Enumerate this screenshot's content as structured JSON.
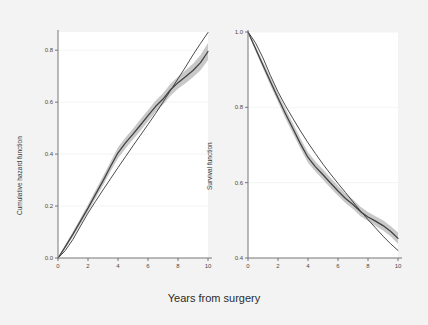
{
  "figure": {
    "background_color": "#f3f3f3",
    "plot_background_color": "#ffffff",
    "xlabel_shared": "Years from surgery"
  },
  "chart_data": [
    {
      "type": "line",
      "panel": "left",
      "title": "",
      "xlabel": "Years from surgery",
      "ylabel": "Cumulative hazard function",
      "xlim": [
        0,
        10
      ],
      "ylim": [
        0.0,
        0.87
      ],
      "xticks": [
        0,
        2,
        4,
        6,
        8,
        10
      ],
      "xtick_labels": [
        "0",
        "2",
        "4",
        "6",
        "8",
        "10"
      ],
      "yticks": [
        0.0,
        0.2,
        0.4,
        0.6,
        0.8
      ],
      "ytick_labels": [
        "0.0",
        "0.2",
        "0.4",
        "0.6",
        "0.8"
      ],
      "grid": "horizontal-faint",
      "legend_position": "none",
      "band_color": "#b3b3b3",
      "line_color": "#404040",
      "reference_line_color": "#2b2b2b",
      "x": [
        0,
        0.25,
        0.5,
        1,
        1.5,
        2,
        2.5,
        3,
        3.5,
        4,
        4.5,
        5,
        5.5,
        6,
        6.5,
        7,
        7.5,
        8,
        8.5,
        9,
        9.5,
        10
      ],
      "series": [
        {
          "name": "Flexible parametric cumulative hazard",
          "values": [
            0.0,
            0.022,
            0.045,
            0.092,
            0.142,
            0.192,
            0.245,
            0.297,
            0.352,
            0.405,
            0.443,
            0.477,
            0.512,
            0.548,
            0.583,
            0.612,
            0.648,
            0.675,
            0.698,
            0.722,
            0.752,
            0.795
          ]
        },
        {
          "name": "Reference (Weibull / straight) cumulative hazard",
          "values": [
            0.0,
            0.014,
            0.03,
            0.072,
            0.123,
            0.173,
            0.218,
            0.262,
            0.305,
            0.348,
            0.39,
            0.432,
            0.473,
            0.514,
            0.556,
            0.6,
            0.645,
            0.69,
            0.735,
            0.782,
            0.826,
            0.868
          ]
        },
        {
          "name": "95% CI lower",
          "values": [
            0.0,
            0.018,
            0.038,
            0.082,
            0.13,
            0.178,
            0.229,
            0.279,
            0.333,
            0.384,
            0.422,
            0.456,
            0.49,
            0.526,
            0.561,
            0.59,
            0.625,
            0.652,
            0.673,
            0.696,
            0.723,
            0.762
          ]
        },
        {
          "name": "95% CI upper",
          "values": [
            0.0,
            0.027,
            0.053,
            0.102,
            0.154,
            0.206,
            0.261,
            0.315,
            0.371,
            0.426,
            0.464,
            0.498,
            0.534,
            0.57,
            0.605,
            0.634,
            0.671,
            0.698,
            0.723,
            0.748,
            0.781,
            0.828
          ]
        }
      ]
    },
    {
      "type": "line",
      "panel": "right",
      "title": "",
      "xlabel": "Years from surgery",
      "ylabel": "Survival function",
      "xlim": [
        0,
        10
      ],
      "ylim": [
        0.4,
        1.0
      ],
      "xticks": [
        0,
        2,
        4,
        6,
        8,
        10
      ],
      "xtick_labels": [
        "0",
        "2",
        "4",
        "6",
        "8",
        "10"
      ],
      "yticks": [
        0.4,
        0.6,
        0.8,
        1.0
      ],
      "ytick_labels": [
        "0.4",
        "0.6",
        "0.8",
        "1.0"
      ],
      "grid": "horizontal-faint",
      "legend_position": "none",
      "band_color": "#b3b3b3",
      "line_color": "#404040",
      "reference_line_color": "#2b2b2b",
      "x": [
        0,
        0.25,
        0.5,
        1,
        1.5,
        2,
        2.5,
        3,
        3.5,
        4,
        4.5,
        5,
        5.5,
        6,
        6.5,
        7,
        7.5,
        8,
        8.5,
        9,
        9.5,
        10
      ],
      "series": [
        {
          "name": "Flexible parametric survival",
          "values": [
            1.0,
            0.978,
            0.956,
            0.912,
            0.868,
            0.825,
            0.783,
            0.743,
            0.703,
            0.667,
            0.642,
            0.621,
            0.599,
            0.578,
            0.558,
            0.542,
            0.523,
            0.509,
            0.498,
            0.486,
            0.471,
            0.452
          ]
        },
        {
          "name": "Reference (Weibull / smooth) survival",
          "values": [
            1.0,
            0.986,
            0.971,
            0.931,
            0.884,
            0.841,
            0.804,
            0.77,
            0.737,
            0.706,
            0.677,
            0.649,
            0.623,
            0.598,
            0.574,
            0.549,
            0.525,
            0.502,
            0.48,
            0.458,
            0.438,
            0.42
          ]
        },
        {
          "name": "95% CI lower",
          "values": [
            1.0,
            0.974,
            0.949,
            0.903,
            0.857,
            0.814,
            0.77,
            0.73,
            0.69,
            0.653,
            0.629,
            0.608,
            0.586,
            0.565,
            0.546,
            0.53,
            0.511,
            0.498,
            0.485,
            0.473,
            0.458,
            0.437
          ]
        },
        {
          "name": "95% CI upper",
          "values": [
            1.0,
            0.982,
            0.963,
            0.921,
            0.879,
            0.837,
            0.796,
            0.757,
            0.717,
            0.681,
            0.656,
            0.635,
            0.613,
            0.592,
            0.571,
            0.555,
            0.536,
            0.522,
            0.511,
            0.5,
            0.485,
            0.468
          ]
        }
      ]
    }
  ]
}
